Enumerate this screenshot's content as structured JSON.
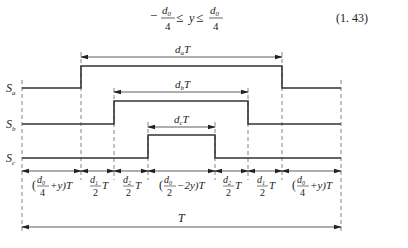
{
  "equation": {
    "minus": "−",
    "numerator": "d",
    "num_sub": "0",
    "denominator": "4",
    "relation1": "≤",
    "variable": "y",
    "relation2": "≤",
    "number": "(1. 43)"
  },
  "signals": [
    {
      "name": "S",
      "sub": "a",
      "high_from": 2,
      "high_to": 5
    },
    {
      "name": "S",
      "sub": "b",
      "high_from": 3,
      "high_to": 4
    },
    {
      "name": "S",
      "sub": "c",
      "high_from": 4,
      "high_to": 4
    }
  ],
  "durations": [
    {
      "label": "d",
      "sub": "a",
      "suffix": "T"
    },
    {
      "label": "d",
      "sub": "b",
      "suffix": "T"
    },
    {
      "label": "d",
      "sub": "c",
      "suffix": "T"
    }
  ],
  "segments": [
    {
      "text": "(d0/4+y)T",
      "paren_open": "(",
      "num": "d",
      "num_sub": "0",
      "den": "4",
      "tail": "+y)T"
    },
    {
      "text": "d1/2 T",
      "paren_open": "",
      "num": "d",
      "num_sub": "1",
      "den": "2",
      "tail": "T"
    },
    {
      "text": "d2/2 T",
      "paren_open": "",
      "num": "d",
      "num_sub": "2",
      "den": "2",
      "tail": "T"
    },
    {
      "text": "(d0/2−2y)T",
      "paren_open": "(",
      "num": "d",
      "num_sub": "0",
      "den": "2",
      "tail": "−2y)T"
    },
    {
      "text": "d2/2 T",
      "paren_open": "",
      "num": "d",
      "num_sub": "2",
      "den": "2",
      "tail": "T"
    },
    {
      "text": "d1/2 T",
      "paren_open": "",
      "num": "d",
      "num_sub": "1",
      "den": "2",
      "tail": "T"
    },
    {
      "text": "(d0/4+y)T",
      "paren_open": "(",
      "num": "d",
      "num_sub": "0",
      "den": "4",
      "tail": "+y)T"
    }
  ],
  "period_label": "T"
}
